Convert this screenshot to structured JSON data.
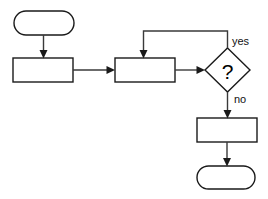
{
  "diagram": {
    "background_color": "#ffffff",
    "stroke_color": "#1a1a1a",
    "connector_color": "#3a3a3a",
    "nodes": [
      {
        "id": "start",
        "type": "terminator",
        "shape": "rounded-rectangle",
        "label": "",
        "x": 14,
        "y": 11,
        "width": 60,
        "height": 24
      },
      {
        "id": "process-1",
        "type": "process",
        "shape": "rectangle",
        "label": "",
        "x": 13,
        "y": 58,
        "width": 60,
        "height": 24
      },
      {
        "id": "process-2",
        "type": "process",
        "shape": "rectangle",
        "label": "",
        "x": 115,
        "y": 58,
        "width": 60,
        "height": 24
      },
      {
        "id": "decision",
        "type": "decision",
        "shape": "diamond",
        "label": "?",
        "x": 205,
        "y": 48,
        "width": 45,
        "height": 44
      },
      {
        "id": "process-3",
        "type": "process",
        "shape": "rectangle",
        "label": "",
        "x": 197,
        "y": 118,
        "width": 60,
        "height": 24
      },
      {
        "id": "end",
        "type": "terminator",
        "shape": "rounded-rectangle",
        "label": "",
        "x": 197,
        "y": 166,
        "width": 58,
        "height": 23
      }
    ],
    "edges": [
      {
        "id": "edge-start-to-process1",
        "from": "start",
        "to": "process-1",
        "label": "",
        "direction": "down"
      },
      {
        "id": "edge-process1-to-process2",
        "from": "process-1",
        "to": "process-2",
        "label": "",
        "direction": "right"
      },
      {
        "id": "edge-process2-to-decision",
        "from": "process-2",
        "to": "decision",
        "label": "",
        "direction": "right"
      },
      {
        "id": "edge-decision-yes-loop",
        "from": "decision",
        "to": "process-2",
        "label": "yes",
        "direction": "up-left-down",
        "label_x": 233,
        "label_y": 42
      },
      {
        "id": "edge-decision-no",
        "from": "decision",
        "to": "process-3",
        "label": "no",
        "direction": "down",
        "label_x": 235,
        "label_y": 100
      },
      {
        "id": "edge-process3-to-end",
        "from": "process-3",
        "to": "end",
        "label": "",
        "direction": "down"
      }
    ],
    "labels": {
      "yes": "yes",
      "no": "no",
      "decision_glyph": "?"
    }
  }
}
